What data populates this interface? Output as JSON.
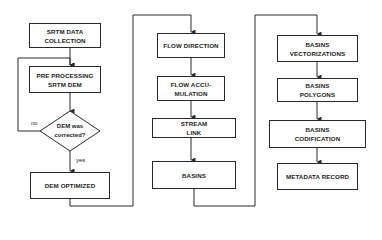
{
  "diagram": {
    "type": "flowchart",
    "columns": [
      {
        "id": "preprocessing",
        "nodes": [
          {
            "id": "srtm_data_collection",
            "shape": "rect",
            "label": "SRTM DATA\nCOLLECTION"
          },
          {
            "id": "pre_processing",
            "shape": "rect",
            "label": "PRE PROCESSING\nSRTM DEM"
          },
          {
            "id": "dem_corrected",
            "shape": "diamond",
            "label": "DEM was\ncorrected?"
          },
          {
            "id": "dem_optimized",
            "shape": "rect",
            "label": "DEM OPTIMIZED"
          }
        ]
      },
      {
        "id": "hydrology",
        "nodes": [
          {
            "id": "flow_direction",
            "shape": "rect",
            "label": "FLOW DIRECTION"
          },
          {
            "id": "flow_accumulation",
            "shape": "rect",
            "label": "FLOW ACCU-\nMULATION"
          },
          {
            "id": "stream_link",
            "shape": "rect",
            "label": "STREAM\nLINK"
          },
          {
            "id": "basins",
            "shape": "rect",
            "label": "BASINS"
          }
        ]
      },
      {
        "id": "vectorization",
        "nodes": [
          {
            "id": "basins_vectorizations",
            "shape": "rect",
            "label": "BASINS\nVECTORIZATIONS"
          },
          {
            "id": "basins_polygons",
            "shape": "rect",
            "label": "BASINS\nPOLYGONS"
          },
          {
            "id": "basins_codification",
            "shape": "rect",
            "label": "BASINS\nCODIFICATION"
          },
          {
            "id": "metadata_record",
            "shape": "rect",
            "label": "METADATA RECORD"
          }
        ]
      }
    ],
    "edges": [
      {
        "from": "srtm_data_collection",
        "to": "pre_processing",
        "label": ""
      },
      {
        "from": "pre_processing",
        "to": "dem_corrected",
        "label": ""
      },
      {
        "from": "dem_corrected",
        "to": "pre_processing",
        "label": "no"
      },
      {
        "from": "dem_corrected",
        "to": "dem_optimized",
        "label": "yes"
      },
      {
        "from": "dem_optimized",
        "to": "flow_direction",
        "label": ""
      },
      {
        "from": "flow_direction",
        "to": "flow_accumulation",
        "label": ""
      },
      {
        "from": "flow_accumulation",
        "to": "stream_link",
        "label": ""
      },
      {
        "from": "stream_link",
        "to": "basins",
        "label": ""
      },
      {
        "from": "basins",
        "to": "basins_vectorizations",
        "label": ""
      },
      {
        "from": "basins_vectorizations",
        "to": "basins_polygons",
        "label": ""
      },
      {
        "from": "basins_polygons",
        "to": "basins_codification",
        "label": ""
      },
      {
        "from": "basins_codification",
        "to": "metadata_record",
        "label": ""
      }
    ],
    "edge_labels": {
      "no": "no",
      "yes": "yes"
    },
    "colors": {
      "line": "#2a2a2a",
      "fill": "#ffffff",
      "text": "#1e1e1e"
    }
  }
}
